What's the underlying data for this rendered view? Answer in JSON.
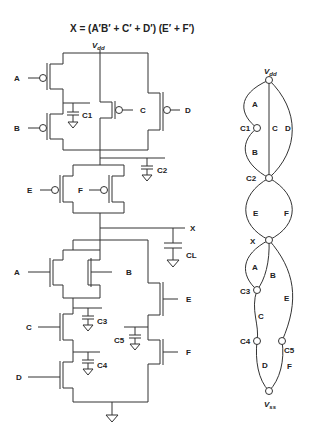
{
  "title": "X = (A′B′ + C′ + D′) (E′ + F′)",
  "schematic": {
    "supply_label": "V",
    "supply_sub": "dd",
    "inputs": {
      "a": "A",
      "b": "B",
      "c": "C",
      "d": "D",
      "e": "E",
      "f": "F"
    },
    "caps": {
      "c1": "C1",
      "c2": "C2",
      "c3": "C3",
      "c4": "C4",
      "c5": "C5",
      "cl": "CL"
    },
    "output": "X"
  },
  "graph": {
    "vdd_label": "V",
    "vdd_sub": "dd",
    "vss_label": "V",
    "vss_sub": "ss",
    "nodes": {
      "c1": "C1",
      "c2": "C2",
      "x": "X",
      "c3": "C3",
      "c4": "C4",
      "c5": "C5"
    },
    "edges": {
      "a_top": "A",
      "b_top": "B",
      "c_top": "C",
      "d_top": "D",
      "e_mid": "E",
      "f_mid": "F",
      "a_bot": "A",
      "b_bot": "B",
      "c_bot": "C",
      "d_bot": "D",
      "e_bot": "E",
      "f_bot": "F"
    }
  }
}
